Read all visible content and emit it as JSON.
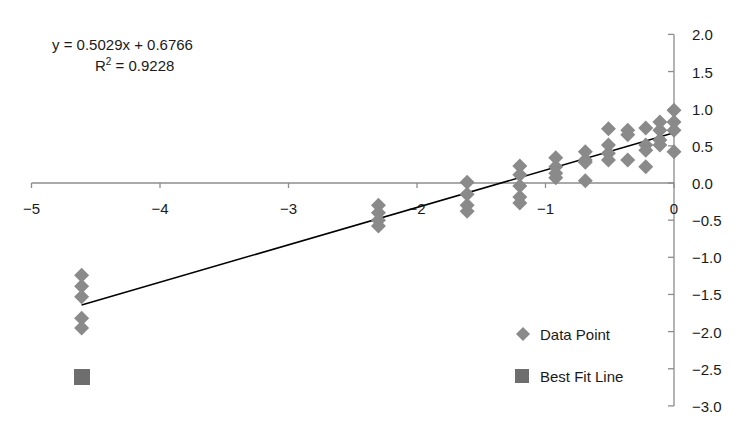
{
  "chart_data": {
    "type": "scatter",
    "title": "",
    "xlabel": "",
    "ylabel": "",
    "xlim": [
      -5,
      0
    ],
    "ylim": [
      -3.0,
      2.0
    ],
    "x_ticks": [
      "−5",
      "−4",
      "−3",
      "−2",
      "−1",
      "0"
    ],
    "y_ticks": [
      "2.0",
      "1.5",
      "1.0",
      "0.5",
      "0.0",
      "−0.5",
      "−1.0",
      "−1.5",
      "−2.0",
      "−2.5",
      "−3.0"
    ],
    "grid": false,
    "legend_position": "lower right",
    "annotation": {
      "equation": "y = 0.5029x + 0.6766",
      "r2_prefix": "R",
      "r2_sup": "2",
      "r2_value": " = 0.9228"
    },
    "series": [
      {
        "name": "Data Point",
        "marker": "diamond",
        "color": "#8a8a8a",
        "points": [
          [
            -4.61,
            -1.24
          ],
          [
            -4.61,
            -1.39
          ],
          [
            -4.61,
            -1.53
          ],
          [
            -4.61,
            -1.82
          ],
          [
            -4.61,
            -1.95
          ],
          [
            -2.3,
            -0.3
          ],
          [
            -2.3,
            -0.4
          ],
          [
            -2.3,
            -0.5
          ],
          [
            -2.3,
            -0.58
          ],
          [
            -1.61,
            0.01
          ],
          [
            -1.61,
            -0.15
          ],
          [
            -1.61,
            -0.3
          ],
          [
            -1.61,
            -0.38
          ],
          [
            -1.2,
            0.23
          ],
          [
            -1.2,
            0.11
          ],
          [
            -1.2,
            -0.04
          ],
          [
            -1.2,
            -0.19
          ],
          [
            -1.2,
            -0.27
          ],
          [
            -0.92,
            0.34
          ],
          [
            -0.92,
            0.22
          ],
          [
            -0.92,
            0.13
          ],
          [
            -0.92,
            0.07
          ],
          [
            -0.69,
            0.42
          ],
          [
            -0.69,
            0.31
          ],
          [
            -0.69,
            0.28
          ],
          [
            -0.69,
            0.03
          ],
          [
            -0.51,
            0.73
          ],
          [
            -0.51,
            0.51
          ],
          [
            -0.51,
            0.4
          ],
          [
            -0.51,
            0.31
          ],
          [
            -0.36,
            0.71
          ],
          [
            -0.36,
            0.65
          ],
          [
            -0.36,
            0.31
          ],
          [
            -0.22,
            0.74
          ],
          [
            -0.22,
            0.51
          ],
          [
            -0.22,
            0.44
          ],
          [
            -0.22,
            0.22
          ],
          [
            -0.11,
            0.82
          ],
          [
            -0.11,
            0.71
          ],
          [
            -0.11,
            0.58
          ],
          [
            -0.11,
            0.51
          ],
          [
            0.0,
            0.98
          ],
          [
            0.0,
            0.82
          ],
          [
            0.0,
            0.71
          ],
          [
            0.0,
            0.42
          ]
        ]
      },
      {
        "name": "Best Fit Line",
        "marker": "square",
        "color": "#6e6e6e",
        "line_color": "#000000",
        "slope": 0.5029,
        "intercept": 0.6766,
        "x_range": [
          -4.61,
          0.0
        ]
      }
    ]
  },
  "legend": {
    "items": [
      {
        "label": "Data Point"
      },
      {
        "label": "Best Fit Line"
      }
    ]
  }
}
